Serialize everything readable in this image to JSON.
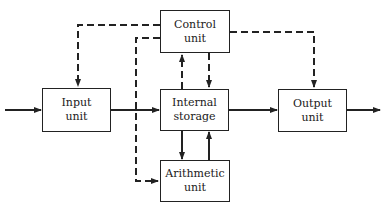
{
  "diagram": {
    "blocks": [
      {
        "id": "control",
        "line1": "Control",
        "line2": "unit"
      },
      {
        "id": "input",
        "line1": "Input",
        "line2": "unit"
      },
      {
        "id": "storage",
        "line1": "Internal",
        "line2": "storage"
      },
      {
        "id": "output",
        "line1": "Output",
        "line2": "unit"
      },
      {
        "id": "arithmetic",
        "line1": "Arithmetic",
        "line2": "unit"
      }
    ],
    "connections": [
      {
        "from": "external",
        "to": "input",
        "style": "solid"
      },
      {
        "from": "input",
        "to": "storage",
        "style": "solid"
      },
      {
        "from": "storage",
        "to": "output",
        "style": "solid"
      },
      {
        "from": "output",
        "to": "external",
        "style": "solid"
      },
      {
        "from": "storage",
        "to": "arithmetic",
        "style": "solid"
      },
      {
        "from": "arithmetic",
        "to": "storage",
        "style": "solid"
      },
      {
        "from": "storage",
        "to": "control",
        "style": "dashed"
      },
      {
        "from": "control",
        "to": "storage",
        "style": "dashed"
      },
      {
        "from": "control",
        "to": "input",
        "style": "dashed"
      },
      {
        "from": "control",
        "to": "output",
        "style": "dashed"
      },
      {
        "from": "control",
        "to": "arithmetic",
        "style": "dashed"
      }
    ]
  }
}
